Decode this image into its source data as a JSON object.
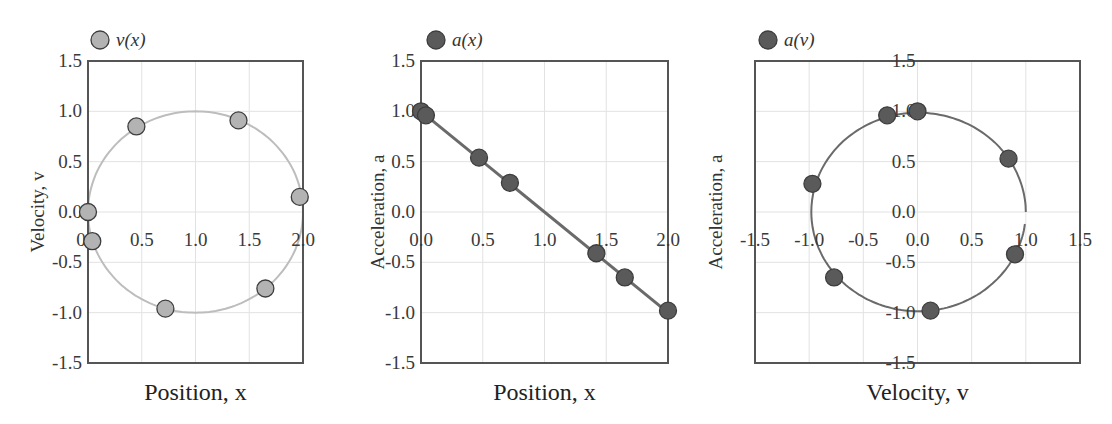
{
  "colors": {
    "light_marker": "#b3b3b3",
    "dark_marker": "#5a5a5a",
    "light_curve": "#bdbdbd",
    "dark_curve": "#6a6a6a",
    "marker_stroke": "#3d3d3d"
  },
  "chart_data": [
    {
      "type": "scatter",
      "legend": "v(x)",
      "xlabel": "Position, x",
      "ylabel": "Velocity, v",
      "xlim": [
        0,
        2
      ],
      "ylim": [
        -1.5,
        1.5
      ],
      "xticks": [
        "0.0",
        "0.5",
        "1.0",
        "1.5",
        "2.0"
      ],
      "yticks": [
        "1.5",
        "1.0",
        "0.5",
        "0.0",
        "-0.5",
        "-1.0",
        "-1.5"
      ],
      "grid": true,
      "curve": "circle centered (1,0) radius 1",
      "series": [
        {
          "name": "v(x)",
          "x": [
            0.0,
            0.04,
            0.45,
            0.72,
            1.4,
            1.65,
            1.97
          ],
          "y": [
            0.0,
            -0.29,
            0.85,
            -0.96,
            0.91,
            -0.76,
            0.15
          ]
        }
      ]
    },
    {
      "type": "scatter",
      "legend": "a(x)",
      "xlabel": "Position, x",
      "ylabel": "Acceleration, a",
      "xlim": [
        0,
        2
      ],
      "ylim": [
        -1.5,
        1.5
      ],
      "xticks": [
        "0.0",
        "0.5",
        "1.0",
        "1.5",
        "2.0"
      ],
      "yticks": [
        "1.5",
        "1.0",
        "0.5",
        "0.0",
        "-0.5",
        "-1.0",
        "-1.5"
      ],
      "grid": true,
      "curve": "line a = 1 - x",
      "series": [
        {
          "name": "a(x)",
          "x": [
            0.0,
            0.04,
            0.47,
            0.72,
            1.42,
            1.65,
            2.0
          ],
          "y": [
            1.0,
            0.96,
            0.54,
            0.29,
            -0.41,
            -0.65,
            -0.98
          ]
        }
      ]
    },
    {
      "type": "scatter",
      "legend": "a(v)",
      "xlabel": "Velocity, v",
      "ylabel": "Acceleration, a",
      "xlim": [
        -1.5,
        1.5
      ],
      "ylim": [
        -1.5,
        1.5
      ],
      "xticks": [
        "-1.5",
        "-1.0",
        "-0.5",
        "0.0",
        "0.5",
        "1.0",
        "1.5"
      ],
      "yticks": [
        "1.5",
        "1.0",
        "0.5",
        "0.0",
        "-0.5",
        "-1.0",
        "-1.5"
      ],
      "grid": true,
      "curve": "near-unit circle arc from (1,0) counterclockwise to (1,-0.1)",
      "series": [
        {
          "name": "a(v)",
          "x": [
            -0.97,
            -0.28,
            0.0,
            0.84,
            0.9,
            -0.77,
            0.12
          ],
          "y": [
            0.28,
            0.96,
            1.0,
            0.53,
            -0.42,
            -0.65,
            -0.98
          ]
        }
      ]
    }
  ]
}
